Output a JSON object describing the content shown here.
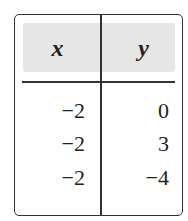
{
  "table": {
    "headers": [
      "x",
      "y"
    ],
    "rows": [
      [
        "−2",
        "0"
      ],
      [
        "−2",
        "3"
      ],
      [
        "−2",
        "−4"
      ]
    ]
  }
}
